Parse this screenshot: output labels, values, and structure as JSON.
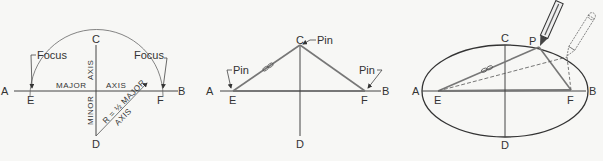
{
  "figure": {
    "panels": [
      {
        "id": "step-1",
        "points": {
          "A": {
            "label": "A",
            "x": 10,
            "y": 91
          },
          "E": {
            "label": "E",
            "x": 32,
            "y": 91
          },
          "C": {
            "label": "C",
            "x": 96,
            "y": 40
          },
          "D": {
            "label": "D",
            "x": 96,
            "y": 143
          },
          "F": {
            "label": "F",
            "x": 161,
            "y": 91
          },
          "B": {
            "label": "B",
            "x": 180,
            "y": 91
          }
        },
        "annotations": {
          "focus_left": "Focus",
          "focus_right": "Focus",
          "major": "MAJOR",
          "axis_major": "AXIS",
          "axis_minor_top": "AXIS",
          "minor": "MINOR",
          "radius_line1": "R = ½ MAJOR",
          "radius_line2": "AXIS"
        }
      },
      {
        "id": "step-2",
        "points": {
          "A": {
            "label": "A",
            "x": 214,
            "y": 91
          },
          "E": {
            "label": "E",
            "x": 233,
            "y": 91
          },
          "C": {
            "label": "C",
            "x": 300,
            "y": 43
          },
          "D": {
            "label": "D",
            "x": 300,
            "y": 143
          },
          "F": {
            "label": "F",
            "x": 365,
            "y": 91
          },
          "B": {
            "label": "B",
            "x": 383,
            "y": 91
          }
        },
        "annotations": {
          "pin_left": "Pin",
          "pin_top": "Pin",
          "pin_right": "Pin"
        }
      },
      {
        "id": "step-3",
        "points": {
          "A": {
            "label": "A",
            "x": 420,
            "y": 91
          },
          "E": {
            "label": "E",
            "x": 438,
            "y": 91
          },
          "C": {
            "label": "C",
            "x": 505,
            "y": 38
          },
          "P": {
            "label": "P",
            "x": 539,
            "y": 47
          },
          "D": {
            "label": "D",
            "x": 505,
            "y": 143
          },
          "F": {
            "label": "F",
            "x": 571,
            "y": 90
          },
          "B": {
            "label": "B",
            "x": 588,
            "y": 91
          }
        },
        "ellipse": {
          "cx": 505,
          "cy": 91,
          "rx": 83,
          "ry": 46
        }
      }
    ],
    "colors": {
      "ink": "#333333",
      "string": "#777777",
      "background": "#f7f7f5"
    }
  }
}
